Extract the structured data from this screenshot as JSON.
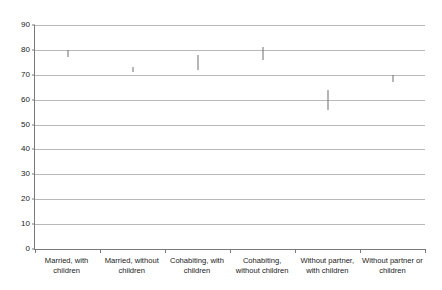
{
  "chart_data": {
    "type": "scatter",
    "title": "",
    "subtitle": "",
    "xlabel": "",
    "ylabel": "",
    "ylim": [
      0,
      90
    ],
    "y_ticks": [
      0,
      10,
      20,
      30,
      40,
      50,
      60,
      70,
      80,
      90
    ],
    "y_tick_labels": [
      "0",
      "10",
      "20",
      "30",
      "40",
      "50",
      "60",
      "70",
      "80",
      "90"
    ],
    "grid": true,
    "legend": "none",
    "marker_style": "vertical-interval-tick",
    "categories": [
      "Married, with children",
      "Married, without children",
      "Cohabiting, with children",
      "Cohabiting, without children",
      "Without partner, with children",
      "Without partner or children"
    ],
    "values": [
      79,
      72,
      75,
      78,
      60,
      68
    ],
    "intervals": [
      {
        "low": 77,
        "high": 80
      },
      {
        "low": 71,
        "high": 73
      },
      {
        "low": 72,
        "high": 78
      },
      {
        "low": 76,
        "high": 81
      },
      {
        "low": 56,
        "high": 64
      },
      {
        "low": 67,
        "high": 70
      }
    ]
  }
}
